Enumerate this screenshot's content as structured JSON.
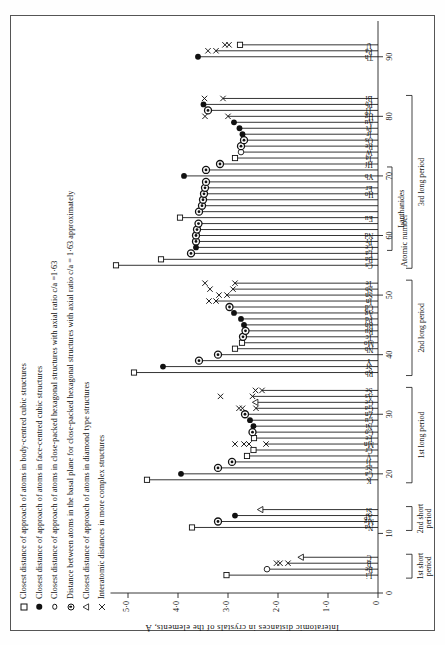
{
  "figure": {
    "y_axis_title": "Interatomic distances  in  crystals  of  the elements,  Å",
    "x_axis_title": "Atomic number"
  },
  "legend": {
    "items": [
      {
        "marker": "open-square",
        "label": "Closest distance of approach of atoms in body-centred cubic structures"
      },
      {
        "marker": "filled-circle",
        "label": "Closest distance of approach of atoms in face-centred cubic structures"
      },
      {
        "marker": "open-circle",
        "label": "Closest distance of approach of atoms in close-packed hexagonal structures with axial ratio c/a =1·63"
      },
      {
        "marker": "bullseye",
        "label": "Distance between atoms in the basal plane for close-packed hexagonal structures with axial ratio c/a = 1·63 approximately"
      },
      {
        "marker": "triangle",
        "label": "Closest distance of approach of atoms in diamond type structures"
      },
      {
        "marker": "cross",
        "label": "Interatomic distances in more complex structures"
      }
    ]
  },
  "chart_data": {
    "type": "bar",
    "title": "",
    "xlabel": "Atomic number",
    "ylabel": "Interatomic distances in crystals of the elements, Å",
    "xlim": [
      0,
      96
    ],
    "ylim": [
      0,
      5.4
    ],
    "xticks": [
      0,
      10,
      20,
      30,
      40,
      50,
      60,
      70,
      80,
      90
    ],
    "xticklabels": [
      "0",
      "10",
      "20",
      "30",
      "40",
      "50",
      "60",
      "70",
      "80",
      "90"
    ],
    "yticks": [
      0,
      1.0,
      2.0,
      3.0,
      4.0,
      5.0
    ],
    "yticklabels": [
      "0",
      "1·0",
      "2·0",
      "3·0",
      "4·0",
      "5·0"
    ],
    "grid": false,
    "legend_position": "top-left",
    "orientation": "vertical-bars-from-zero",
    "period_brackets": [
      {
        "label": "1st short\nperiod",
        "z_start": 3,
        "z_end": 6
      },
      {
        "label": "2nd short\nperiod",
        "z_start": 11,
        "z_end": 14
      },
      {
        "label": "1st long period",
        "z_start": 19,
        "z_end": 34
      },
      {
        "label": "2nd long period",
        "z_start": 37,
        "z_end": 52
      },
      {
        "label": "3rd long period",
        "z_start": 55,
        "z_end": 83
      },
      {
        "label": "Lanthanides",
        "z_start": 58,
        "z_end": 71
      }
    ],
    "points": [
      {
        "z": 3,
        "symbol": "Li",
        "value": 3.03,
        "marker": "open-square",
        "show_symbol": true
      },
      {
        "z": 4,
        "symbol": "Be",
        "value": 2.22,
        "marker": "open-circle",
        "show_symbol": true
      },
      {
        "z": 5,
        "symbol": "B",
        "value": 1.8,
        "marker": "cross",
        "show_symbol": true
      },
      {
        "z": 6,
        "symbol": "C",
        "value": 1.54,
        "marker": "triangle",
        "show_symbol": true
      },
      {
        "z": 11,
        "symbol": "Na",
        "value": 3.72,
        "marker": "open-square",
        "show_symbol": true
      },
      {
        "z": 12,
        "symbol": "Mg",
        "value": 3.2,
        "marker": "bullseye",
        "show_symbol": true
      },
      {
        "z": 13,
        "symbol": "Al",
        "value": 2.86,
        "marker": "filled-circle",
        "show_symbol": true
      },
      {
        "z": 14,
        "symbol": "Si",
        "value": 2.35,
        "marker": "triangle",
        "show_symbol": true
      },
      {
        "z": 19,
        "symbol": "K",
        "value": 4.62,
        "marker": "open-square",
        "show_symbol": true
      },
      {
        "z": 20,
        "symbol": "Ca",
        "value": 3.94,
        "marker": "filled-circle",
        "show_symbol": true
      },
      {
        "z": 21,
        "symbol": "Sc",
        "value": 3.2,
        "marker": "bullseye",
        "show_symbol": true
      },
      {
        "z": 22,
        "symbol": "Ti",
        "value": 2.92,
        "marker": "bullseye",
        "show_symbol": true
      },
      {
        "z": 23,
        "symbol": "V",
        "value": 2.62,
        "marker": "open-square",
        "show_symbol": true
      },
      {
        "z": 24,
        "symbol": "Cr",
        "value": 2.49,
        "marker": "open-square",
        "show_symbol": true
      },
      {
        "z": 25,
        "symbol": "Mn",
        "value": 2.24,
        "marker": "cross",
        "show_symbol": true
      },
      {
        "z": 26,
        "symbol": "Fe",
        "value": 2.48,
        "marker": "open-square",
        "show_symbol": true
      },
      {
        "z": 27,
        "symbol": "Co",
        "value": 2.51,
        "marker": "bullseye",
        "show_symbol": true
      },
      {
        "z": 28,
        "symbol": "Ni",
        "value": 2.49,
        "marker": "filled-circle",
        "show_symbol": true
      },
      {
        "z": 29,
        "symbol": "Cu",
        "value": 2.56,
        "marker": "filled-circle",
        "show_symbol": true
      },
      {
        "z": 30,
        "symbol": "Zn",
        "value": 2.66,
        "marker": "bullseye",
        "show_symbol": true
      },
      {
        "z": 31,
        "symbol": "Ga",
        "value": 2.44,
        "marker": "cross",
        "show_symbol": true
      },
      {
        "z": 32,
        "symbol": "Ge",
        "value": 2.45,
        "marker": "triangle",
        "show_symbol": true
      },
      {
        "z": 33,
        "symbol": "As",
        "value": 2.51,
        "marker": "cross",
        "show_symbol": true
      },
      {
        "z": 34,
        "symbol": "Se",
        "value": 2.32,
        "marker": "cross",
        "show_symbol": true
      },
      {
        "z": 37,
        "symbol": "Rb",
        "value": 4.88,
        "marker": "open-square",
        "show_symbol": true
      },
      {
        "z": 38,
        "symbol": "Sr",
        "value": 4.3,
        "marker": "filled-circle",
        "show_symbol": true
      },
      {
        "z": 39,
        "symbol": "Y",
        "value": 3.58,
        "marker": "bullseye",
        "show_symbol": true
      },
      {
        "z": 40,
        "symbol": "Zr",
        "value": 3.2,
        "marker": "bullseye",
        "show_symbol": false
      },
      {
        "z": 41,
        "symbol": "Nb",
        "value": 2.86,
        "marker": "open-square",
        "show_symbol": true
      },
      {
        "z": 42,
        "symbol": "Mo",
        "value": 2.72,
        "marker": "open-square",
        "show_symbol": true
      },
      {
        "z": 43,
        "symbol": "Tc",
        "value": 2.7,
        "marker": "bullseye",
        "show_symbol": true
      },
      {
        "z": 44,
        "symbol": "Ru",
        "value": 2.65,
        "marker": "bullseye",
        "show_symbol": true
      },
      {
        "z": 45,
        "symbol": "Rh",
        "value": 2.68,
        "marker": "filled-circle",
        "show_symbol": true
      },
      {
        "z": 46,
        "symbol": "Pd",
        "value": 2.74,
        "marker": "filled-circle",
        "show_symbol": true
      },
      {
        "z": 47,
        "symbol": "Ag",
        "value": 2.88,
        "marker": "filled-circle",
        "show_symbol": true
      },
      {
        "z": 48,
        "symbol": "Cd",
        "value": 2.97,
        "marker": "bullseye",
        "show_symbol": true
      },
      {
        "z": 49,
        "symbol": "In",
        "value": 3.24,
        "marker": "cross",
        "show_symbol": true
      },
      {
        "z": 50,
        "symbol": "Sn",
        "value": 3.02,
        "marker": "cross",
        "show_symbol": true
      },
      {
        "z": 51,
        "symbol": "Sb",
        "value": 2.9,
        "marker": "cross",
        "show_symbol": true
      },
      {
        "z": 52,
        "symbol": "Te",
        "value": 2.86,
        "marker": "cross",
        "show_symbol": true
      },
      {
        "z": 55,
        "symbol": "Cs",
        "value": 5.24,
        "marker": "open-square",
        "show_symbol": true
      },
      {
        "z": 56,
        "symbol": "Ba",
        "value": 4.34,
        "marker": "open-square",
        "show_symbol": true
      },
      {
        "z": 57,
        "symbol": "La",
        "value": 3.74,
        "marker": "bullseye",
        "show_symbol": true
      },
      {
        "z": 58,
        "symbol": "Ce",
        "value": 3.64,
        "marker": "filled-circle",
        "show_symbol": true
      },
      {
        "z": 59,
        "symbol": "Pr",
        "value": 3.64,
        "marker": "bullseye",
        "show_symbol": true
      },
      {
        "z": 60,
        "symbol": "Nd",
        "value": 3.64,
        "marker": "bullseye",
        "show_symbol": true
      },
      {
        "z": 61,
        "symbol": "Pm",
        "value": 3.62,
        "marker": "bullseye",
        "show_symbol": false
      },
      {
        "z": 62,
        "symbol": "Sm",
        "value": 3.59,
        "marker": "bullseye",
        "show_symbol": false
      },
      {
        "z": 63,
        "symbol": "Eu",
        "value": 3.96,
        "marker": "open-square",
        "show_symbol": true
      },
      {
        "z": 64,
        "symbol": "Gd",
        "value": 3.58,
        "marker": "bullseye",
        "show_symbol": false
      },
      {
        "z": 65,
        "symbol": "Tb",
        "value": 3.52,
        "marker": "bullseye",
        "show_symbol": false
      },
      {
        "z": 66,
        "symbol": "Dy",
        "value": 3.5,
        "marker": "bullseye",
        "show_symbol": false
      },
      {
        "z": 67,
        "symbol": "Ho",
        "value": 3.48,
        "marker": "bullseye",
        "show_symbol": true
      },
      {
        "z": 68,
        "symbol": "Er",
        "value": 3.46,
        "marker": "bullseye",
        "show_symbol": true
      },
      {
        "z": 69,
        "symbol": "Tm",
        "value": 3.44,
        "marker": "bullseye",
        "show_symbol": false
      },
      {
        "z": 70,
        "symbol": "Yb",
        "value": 3.88,
        "marker": "filled-circle",
        "show_symbol": true
      },
      {
        "z": 71,
        "symbol": "Lu",
        "value": 3.44,
        "marker": "bullseye",
        "show_symbol": false
      },
      {
        "z": 72,
        "symbol": "Hf",
        "value": 3.16,
        "marker": "bullseye",
        "show_symbol": true
      },
      {
        "z": 73,
        "symbol": "Ta",
        "value": 2.86,
        "marker": "open-square",
        "show_symbol": true
      },
      {
        "z": 74,
        "symbol": "W",
        "value": 2.74,
        "marker": "open-circle",
        "show_symbol": true
      },
      {
        "z": 75,
        "symbol": "Re",
        "value": 2.74,
        "marker": "bullseye",
        "show_symbol": true
      },
      {
        "z": 76,
        "symbol": "Os",
        "value": 2.68,
        "marker": "bullseye",
        "show_symbol": true
      },
      {
        "z": 77,
        "symbol": "Ir",
        "value": 2.71,
        "marker": "filled-circle",
        "show_symbol": true
      },
      {
        "z": 78,
        "symbol": "Pt",
        "value": 2.77,
        "marker": "filled-circle",
        "show_symbol": true
      },
      {
        "z": 79,
        "symbol": "Au",
        "value": 2.88,
        "marker": "filled-circle",
        "show_symbol": true
      },
      {
        "z": 80,
        "symbol": "Hg",
        "value": 3.0,
        "marker": "cross",
        "show_symbol": true
      },
      {
        "z": 81,
        "symbol": "Tl",
        "value": 3.4,
        "marker": "bullseye",
        "show_symbol": true
      },
      {
        "z": 82,
        "symbol": "Pb",
        "value": 3.49,
        "marker": "filled-circle",
        "show_symbol": true
      },
      {
        "z": 83,
        "symbol": "Bi",
        "value": 3.1,
        "marker": "cross",
        "show_symbol": true
      },
      {
        "z": 90,
        "symbol": "Th",
        "value": 3.6,
        "marker": "filled-circle",
        "show_symbol": true
      },
      {
        "z": 91,
        "symbol": "Pa",
        "value": 3.24,
        "marker": "cross",
        "show_symbol": true
      },
      {
        "z": 92,
        "symbol": "U",
        "value": 2.76,
        "marker": "open-square",
        "show_symbol": true
      }
    ],
    "extra_crosses": [
      {
        "z": 25,
        "value": 2.58
      },
      {
        "z": 25,
        "value": 2.68
      },
      {
        "z": 25,
        "value": 2.86
      },
      {
        "z": 31,
        "value": 2.71
      },
      {
        "z": 31,
        "value": 2.78
      },
      {
        "z": 33,
        "value": 3.15
      },
      {
        "z": 34,
        "value": 2.45
      },
      {
        "z": 49,
        "value": 3.38
      },
      {
        "z": 50,
        "value": 3.18
      },
      {
        "z": 51,
        "value": 3.36
      },
      {
        "z": 52,
        "value": 3.46
      },
      {
        "z": 80,
        "value": 3.46
      },
      {
        "z": 83,
        "value": 3.47
      },
      {
        "z": 91,
        "value": 3.4
      },
      {
        "z": 92,
        "value": 2.98
      },
      {
        "z": 92,
        "value": 3.06
      },
      {
        "z": 5,
        "value": 1.96
      },
      {
        "z": 5,
        "value": 2.03
      }
    ]
  }
}
